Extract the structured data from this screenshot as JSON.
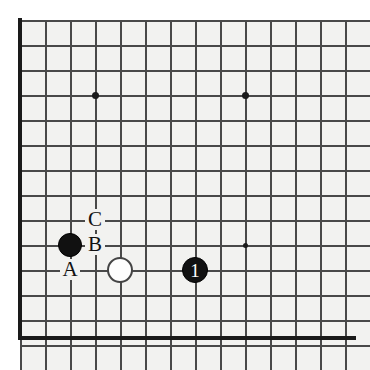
{
  "diagram": {
    "type": "go-board-problem",
    "board_style": "grid",
    "colors": {
      "board_background": "#f2f2f0",
      "grid_line": "#494949",
      "border": "#1a1a1a",
      "black_stone": "#111111",
      "white_stone": "#fdfdfd",
      "label_text": "#111111",
      "stone_number_text": "#ffffff"
    },
    "geometry": {
      "origin_x": 20,
      "origin_y": 20,
      "cell": 25,
      "cols": 13,
      "rows": 13
    },
    "star_points": [
      {
        "name": "star-point-upper-left",
        "col": 3,
        "row": 3,
        "size": "large"
      },
      {
        "name": "star-point-upper-right",
        "col": 9,
        "row": 3,
        "size": "large"
      },
      {
        "name": "star-point-lower-right",
        "col": 9,
        "row": 9,
        "size": "small"
      }
    ],
    "stones": [
      {
        "name": "black-stone-corner",
        "color": "black",
        "col": 2,
        "row": 9,
        "radius": 12,
        "number": ""
      },
      {
        "name": "white-stone-contact",
        "color": "white",
        "col": 4,
        "row": 10,
        "radius": 13,
        "number": ""
      },
      {
        "name": "black-stone-move-1",
        "color": "black",
        "col": 7,
        "row": 10,
        "radius": 13,
        "number": "1"
      }
    ],
    "point_labels": [
      {
        "name": "point-label-c",
        "text": "C",
        "col": 3,
        "row": 8
      },
      {
        "name": "point-label-b",
        "text": "B",
        "col": 3,
        "row": 9
      },
      {
        "name": "point-label-a",
        "text": "A",
        "col": 2,
        "row": 10
      }
    ]
  }
}
